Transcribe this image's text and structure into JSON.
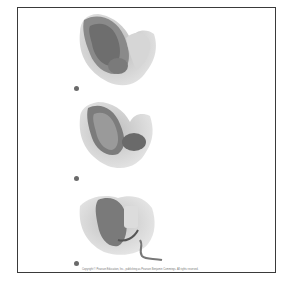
{
  "slide": {
    "stages": [
      {
        "label": "Fetal position stage 1",
        "bullet": "•"
      },
      {
        "label": "Fetal position stage 2",
        "bullet": "•"
      },
      {
        "label": "Fetal position stage 3",
        "bullet": "•"
      }
    ],
    "caption": "Copyright © Pearson Education, Inc., publishing as Pearson Benjamin Cummings. All rights reserved."
  }
}
